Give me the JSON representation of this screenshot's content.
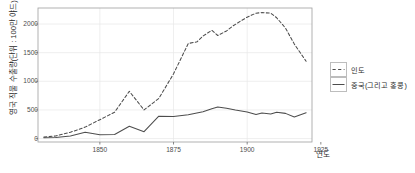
{
  "chart_data": {
    "type": "line",
    "title": "",
    "xlabel": "연도",
    "ylabel": "영국 직물 수출량(단위 : 100만 야드)",
    "xlim": [
      1829,
      1922
    ],
    "ylim": [
      -60,
      2280
    ],
    "xticks": [
      "1850",
      "1875",
      "1900",
      "1925"
    ],
    "xtick_values": [
      1850,
      1875,
      1900,
      1925
    ],
    "yticks": [
      "0",
      "500",
      "1000",
      "1500",
      "2000"
    ],
    "ytick_values": [
      0,
      500,
      1000,
      1500,
      2000
    ],
    "grid": true,
    "legend_position": "right",
    "series": [
      {
        "name": "인도",
        "style": "dashed",
        "color": "#4d4d4d",
        "x": [
          1831,
          1835,
          1840,
          1845,
          1850,
          1855,
          1860,
          1865,
          1870,
          1875,
          1880,
          1883,
          1885,
          1888,
          1890,
          1893,
          1895,
          1898,
          1900,
          1903,
          1905,
          1908,
          1910,
          1913,
          1916,
          1920
        ],
        "values": [
          25,
          45,
          110,
          200,
          330,
          460,
          825,
          500,
          700,
          1130,
          1660,
          1690,
          1790,
          1890,
          1800,
          1880,
          1960,
          2060,
          2120,
          2190,
          2200,
          2190,
          2110,
          1930,
          1650,
          1350
        ]
      },
      {
        "name": "중국(그리고 홍콩)",
        "style": "solid",
        "color": "#4d4d4d",
        "x": [
          1831,
          1835,
          1840,
          1845,
          1850,
          1855,
          1860,
          1865,
          1870,
          1875,
          1880,
          1885,
          1888,
          1890,
          1893,
          1896,
          1900,
          1903,
          1905,
          1908,
          1910,
          1913,
          1916,
          1920
        ],
        "values": [
          15,
          20,
          45,
          110,
          65,
          70,
          215,
          120,
          390,
          385,
          415,
          470,
          520,
          550,
          530,
          500,
          465,
          420,
          445,
          430,
          460,
          440,
          375,
          450
        ]
      }
    ]
  },
  "legend": {
    "items": [
      {
        "label": "인도",
        "style": "dashed"
      },
      {
        "label": "중국(그리고 홍콩)",
        "style": "solid"
      }
    ]
  }
}
